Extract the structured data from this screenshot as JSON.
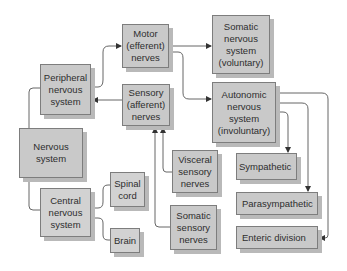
{
  "diagram": {
    "nodes": {
      "nervous_system": "Nervous\nsystem",
      "peripheral": "Peripheral\nnervous\nsystem",
      "central": "Central\nnervous\nsystem",
      "motor": "Motor\n(efferent)\nnerves",
      "sensory": "Sensory\n(afferent)\nnerves",
      "somatic_ns": "Somatic\nnervous\nsystem\n(voluntary)",
      "autonomic_ns": "Autonomic\nnervous\nsystem\n(involuntary)",
      "spinal_cord": "Spinal\ncord",
      "brain": "Brain",
      "visceral_sensory": "Visceral\nsensory\nnerves",
      "somatic_sensory": "Somatic\nsensory\nnerves",
      "sympathetic": "Sympathetic",
      "parasympathetic": "Parasympathetic",
      "enteric": "Enteric division"
    },
    "edges": [
      {
        "from": "nervous_system",
        "to": "peripheral"
      },
      {
        "from": "nervous_system",
        "to": "central"
      },
      {
        "from": "central",
        "to": "spinal_cord"
      },
      {
        "from": "central",
        "to": "brain"
      },
      {
        "from": "peripheral",
        "to": "motor",
        "arrow": true
      },
      {
        "from": "sensory",
        "to": "peripheral",
        "arrow": true
      },
      {
        "from": "motor",
        "to": "somatic_ns",
        "arrow": true
      },
      {
        "from": "motor",
        "to": "autonomic_ns",
        "arrow": true
      },
      {
        "from": "visceral_sensory",
        "to": "sensory",
        "arrow": true
      },
      {
        "from": "somatic_sensory",
        "to": "sensory",
        "arrow": true
      },
      {
        "from": "autonomic_ns",
        "to": "sympathetic",
        "arrow": true
      },
      {
        "from": "autonomic_ns",
        "to": "parasympathetic",
        "arrow": true
      },
      {
        "from": "autonomic_ns",
        "to": "enteric",
        "arrow": true
      }
    ],
    "colors": {
      "box_fill": "#c9c9c9",
      "box_border": "#7d7d7d",
      "box_shadow": "#b9b9b9",
      "line": "#555555",
      "text": "#2e2e2e"
    }
  }
}
